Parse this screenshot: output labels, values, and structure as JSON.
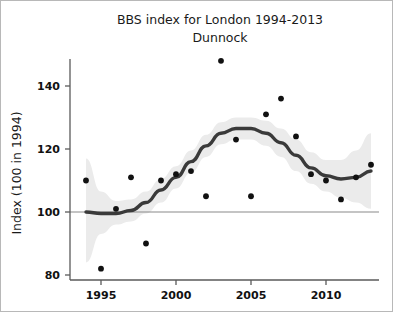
{
  "figure": {
    "title": "BBS index for London 1994-2013",
    "subtitle": "Dunnock"
  },
  "axes": {
    "ylabel": "Index (100 in 1994)",
    "xlabel": "",
    "yticks": [
      "80",
      "100",
      "120",
      "140"
    ],
    "xticks": [
      "1995",
      "2000",
      "2005",
      "2010"
    ]
  },
  "colors": {
    "background": "#ffffff",
    "frame": "#b8b8b8",
    "axis": "#5a5a5a",
    "point": "#111111",
    "trend": "#3a3a3a",
    "band": "#ebebeb",
    "reference_line": "#8a8a8a",
    "text": "#1a1a1a"
  },
  "chart_data": {
    "type": "scatter",
    "title": "BBS index for London 1994-2013",
    "subtitle": "Dunnock",
    "xlabel": "",
    "ylabel": "Index (100 in 1994)",
    "xlim": [
      1993.4,
      2013.6
    ],
    "ylim": [
      76,
      152
    ],
    "xticks": [
      1995,
      2000,
      2005,
      2010
    ],
    "yticks": [
      80,
      100,
      120,
      140
    ],
    "grid": false,
    "legend": "none",
    "reference_line": {
      "y": 100,
      "label": "baseline (100 in 1994)"
    },
    "x": [
      1994,
      1995,
      1996,
      1997,
      1998,
      1999,
      2000,
      2001,
      2002,
      2003,
      2004,
      2005,
      2006,
      2007,
      2008,
      2009,
      2010,
      2011,
      2012,
      2013
    ],
    "series": [
      {
        "name": "Annual index",
        "type": "scatter",
        "values": [
          110,
          82,
          101,
          111,
          90,
          110,
          112,
          113,
          105,
          148,
          123,
          105,
          131,
          136,
          124,
          112,
          110,
          104,
          111,
          115
        ]
      },
      {
        "name": "Smoothed trend",
        "type": "line",
        "values": [
          100,
          99.5,
          99.5,
          100.5,
          103,
          107,
          111,
          116,
          121,
          125,
          126.5,
          126.5,
          125,
          122,
          118,
          114,
          111.5,
          110.5,
          111,
          113
        ]
      },
      {
        "name": "Confidence band lower",
        "type": "band",
        "values": [
          84,
          93,
          96,
          97,
          99.5,
          103,
          107.5,
          112.5,
          117.5,
          121.5,
          123,
          123,
          121,
          117.5,
          113,
          109,
          106.5,
          104.5,
          103,
          101
        ]
      },
      {
        "name": "Confidence band upper",
        "type": "band",
        "values": [
          117,
          106.5,
          103.5,
          104,
          106.5,
          110.5,
          114.5,
          119.5,
          124.5,
          128.5,
          130,
          130,
          129,
          126.5,
          123,
          119,
          116.5,
          116.5,
          119.5,
          125
        ]
      }
    ]
  }
}
